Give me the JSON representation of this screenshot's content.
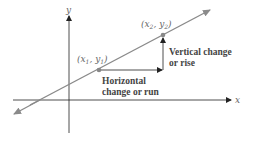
{
  "diagram": {
    "type": "slope-of-line",
    "axes": {
      "x_label": "x",
      "y_label": "y"
    },
    "points": [
      {
        "id": "p1",
        "label_base_x": "x",
        "label_sub_x": "1",
        "label_base_y": "y",
        "label_sub_y": "1"
      },
      {
        "id": "p2",
        "label_base_x": "x",
        "label_sub_x": "2",
        "label_base_y": "y",
        "label_sub_y": "2"
      }
    ],
    "annotations": {
      "horizontal_line1": "Horizontal",
      "horizontal_line2": "change or run",
      "vertical_line1": "Vertical change",
      "vertical_line2": "or rise"
    },
    "colors": {
      "line": "#8a8a8a",
      "axis": "#222222",
      "text": "#444444"
    }
  }
}
